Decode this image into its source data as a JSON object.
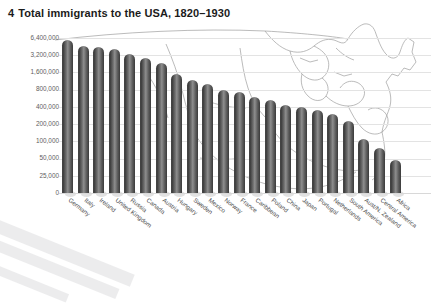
{
  "title": {
    "number": "4",
    "text": "Total immigrants to the USA, 1820–1930"
  },
  "chart_data": {
    "type": "bar",
    "title": "Total immigrants to the USA, 1820–1930",
    "xlabel": "",
    "ylabel": "",
    "scale": "logarithmic",
    "grid": true,
    "legend": null,
    "ytick_labels": [
      "6,400,000",
      "3,200,000",
      "1,600,000",
      "800,000",
      "400,000",
      "200,000",
      "100,000",
      "50,000",
      "25,000",
      "0"
    ],
    "ytick_values": [
      6400000,
      3200000,
      1600000,
      800000,
      400000,
      200000,
      100000,
      50000,
      25000,
      0
    ],
    "ylim": [
      0,
      6400000
    ],
    "categories": [
      "Germany",
      "Italy",
      "Ireland",
      "United Kingdom",
      "Russia",
      "Canada",
      "Austria",
      "Hungary",
      "Sweden",
      "Mexico",
      "Norway",
      "France",
      "Caribbean",
      "Poland",
      "China",
      "Japan",
      "Portugal",
      "Netherlands",
      "South America",
      "Aust/N. Zealand",
      "Central America",
      "Africa"
    ],
    "values": [
      5900000,
      4600000,
      4400000,
      4100000,
      3300000,
      2900000,
      2300000,
      1500000,
      1200000,
      1000000,
      800000,
      720000,
      600000,
      520000,
      440000,
      400000,
      360000,
      300000,
      230000,
      110000,
      75000,
      48000
    ],
    "value_labels": [
      "5,900,000",
      "4,600,000",
      "4,400,000",
      "4,100,000",
      "3,300,000",
      "2,900,000",
      "2,300,000",
      "1,500,000",
      "1,200,000",
      "1,000,000",
      "800,000",
      "720,000",
      "600,000",
      "520,000",
      "440,000",
      "400,000",
      "360,000",
      "300,000",
      "230,000",
      "110,000",
      "75,000",
      "48,000"
    ]
  },
  "colors": {
    "bar_dark": "#3a3a3a",
    "bar_light": "#8e8e8e",
    "grid": "#e3e3e3",
    "text": "#4a4a4a",
    "title": "#1b1b1b",
    "map_outline": "#9a9a9a",
    "band": "#e9e9ea"
  },
  "background": {
    "map_name": "usa-outline-map"
  }
}
